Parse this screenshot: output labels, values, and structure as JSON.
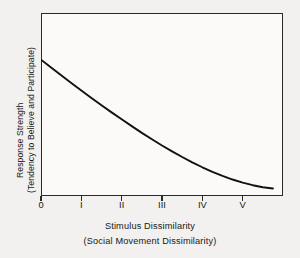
{
  "chart_data": {
    "type": "line",
    "title": "",
    "xlabel": "Stimulus Dissimilarity",
    "xlabel_sub": "(Social Movement Dissimilarity)",
    "ylabel": "Response Strength",
    "ylabel_sub": "(Tendency to Believe and Participate)",
    "grid": false,
    "legend": "none",
    "xlim": [
      0,
      6
    ],
    "ylim": [
      0,
      1
    ],
    "xticklabels": [
      "0",
      "I",
      "II",
      "III",
      "IV",
      "V"
    ],
    "xtickvalues": [
      0,
      1,
      2,
      3,
      4,
      5
    ],
    "yticklabels": [],
    "series": [
      {
        "name": "response-decay-curve",
        "x": [
          0.0,
          0.25,
          0.5,
          0.75,
          1.0,
          1.25,
          1.5,
          1.75,
          2.0,
          2.25,
          2.5,
          2.75,
          3.0,
          3.25,
          3.5,
          3.75,
          4.0,
          4.25,
          4.5,
          4.75,
          5.0,
          5.25,
          5.5,
          5.75
        ],
        "y": [
          0.745,
          0.702,
          0.66,
          0.618,
          0.577,
          0.536,
          0.496,
          0.457,
          0.419,
          0.382,
          0.345,
          0.31,
          0.276,
          0.244,
          0.213,
          0.184,
          0.157,
          0.132,
          0.11,
          0.09,
          0.073,
          0.059,
          0.048,
          0.041
        ]
      }
    ]
  },
  "axes": {
    "ticks": [
      {
        "label": "0",
        "value": 0
      },
      {
        "label": "I",
        "value": 1
      },
      {
        "label": "II",
        "value": 2
      },
      {
        "label": "III",
        "value": 3
      },
      {
        "label": "IV",
        "value": 4
      },
      {
        "label": "V",
        "value": 5
      }
    ]
  },
  "colors": {
    "page_background": "#f2f1ef",
    "plot_background": "#fbfaf8",
    "frame": "#2a2a2a",
    "curve": "#111111",
    "text": "#181818"
  }
}
